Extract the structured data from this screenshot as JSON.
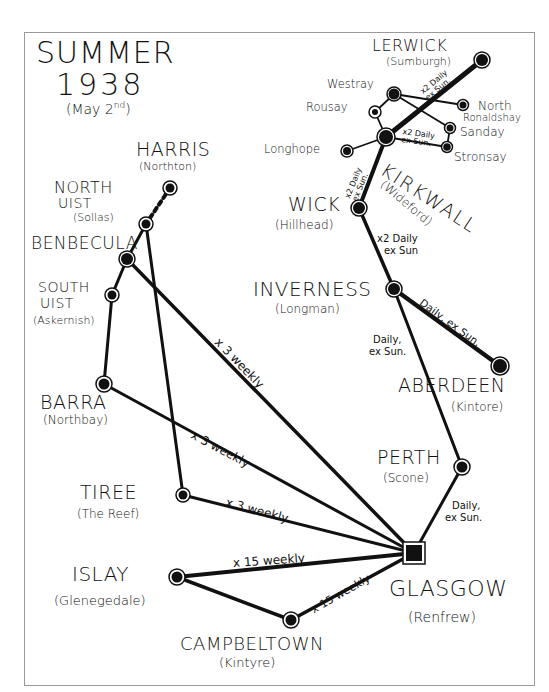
{
  "title": {
    "line1": "SUMMER",
    "line2": "1938",
    "line3_prefix": "(May 2",
    "line3_sup": "nd",
    "line3_suffix": ")"
  },
  "colors": {
    "background": "#ffffff",
    "ink": "#111111",
    "frame": "#9a9a9a"
  },
  "places": {
    "lerwick": {
      "name": "LERWICK",
      "airfield": "(Sumburgh)"
    },
    "westray": {
      "name": "Westray"
    },
    "rousay": {
      "name": "Rousay"
    },
    "north_ronaldshay": {
      "name": "North",
      "name2": "Ronaldshay"
    },
    "sanday": {
      "name": "Sanday"
    },
    "stronsay": {
      "name": "Stronsay"
    },
    "longhope": {
      "name": "Longhope"
    },
    "kirkwall": {
      "name": "KIRKWALL",
      "airfield": "(Wideford)"
    },
    "wick": {
      "name": "WICK",
      "airfield": "(Hillhead)"
    },
    "inverness": {
      "name": "INVERNESS",
      "airfield": "(Longman)"
    },
    "aberdeen": {
      "name": "ABERDEEN",
      "airfield": "(Kintore)"
    },
    "perth": {
      "name": "PERTH",
      "airfield": "(Scone)"
    },
    "glasgow": {
      "name": "GLASGOW",
      "airfield": "(Renfrew)"
    },
    "harris": {
      "name": "HARRIS",
      "airfield": "(Northton)"
    },
    "north_uist": {
      "name": "NORTH",
      "name2": "UIST",
      "airfield": "(Sollas)"
    },
    "benbecula": {
      "name": "BENBECULA"
    },
    "south_uist": {
      "name": "SOUTH",
      "name2": "UIST",
      "airfield": "(Askernish)"
    },
    "barra": {
      "name": "BARRA",
      "airfield": "(Northbay)"
    },
    "tiree": {
      "name": "TIREE",
      "airfield": "(The Reef)"
    },
    "islay": {
      "name": "ISLAY",
      "airfield": "(Glenegedale)"
    },
    "campbeltown": {
      "name": "CAMPBELTOWN",
      "airfield": "(Kintyre)"
    }
  },
  "routes": {
    "lerwick_kirkwall": "x2 Daily ex Sun.",
    "kirkwall_stronsay": "x2 Daily ex Sun.",
    "kirkwall_wick": "x2 Daily ex Sun.",
    "wick_inverness_1": "x2 Daily",
    "wick_inverness_2": "ex Sun",
    "inverness_aberdeen": "Daily, ex Sun.",
    "inverness_perth_1": "Daily,",
    "inverness_perth_2": "ex Sun.",
    "perth_glasgow_1": "Daily,",
    "perth_glasgow_2": "ex Sun.",
    "benbecula_glasgow": "x 3 weekly",
    "barra_glasgow": "x 3 weekly",
    "tiree_glasgow": "x 3 weekly",
    "islay_glasgow": "x 15 weekly",
    "campbeltown_glasgow": "x 15 weekly"
  }
}
